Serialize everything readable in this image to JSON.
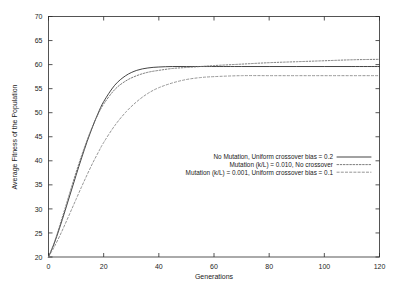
{
  "chart_data": {
    "type": "line",
    "title": "",
    "xlabel": "Generations",
    "ylabel": "Average Fitness of the Population",
    "xlim": [
      0,
      120
    ],
    "ylim": [
      20,
      70
    ],
    "xticks": [
      "0",
      "20",
      "40",
      "60",
      "80",
      "100",
      "120"
    ],
    "xtick_values": [
      0,
      20,
      40,
      60,
      80,
      100,
      120
    ],
    "yticks": [
      "20",
      "25",
      "30",
      "35",
      "40",
      "45",
      "50",
      "55",
      "60",
      "65",
      "70"
    ],
    "ytick_values": [
      20,
      25,
      30,
      35,
      40,
      45,
      50,
      55,
      60,
      65,
      70
    ],
    "grid": false,
    "legend_position": "center-right",
    "x": [
      0,
      2,
      4,
      6,
      8,
      10,
      12,
      14,
      16,
      18,
      20,
      24,
      28,
      32,
      36,
      40,
      45,
      50,
      55,
      60,
      70,
      80,
      90,
      100,
      110,
      120
    ],
    "series": [
      {
        "name": "No Mutation, Uniform crossover bias = 0.2",
        "style": "solid",
        "color": "#2f2f2f",
        "values": [
          20.0,
          22.7,
          26.0,
          29.6,
          33.3,
          37.0,
          40.6,
          44.0,
          47.1,
          49.9,
          52.3,
          55.7,
          57.7,
          58.8,
          59.3,
          59.5,
          59.6,
          59.6,
          59.6,
          59.6,
          59.6,
          59.6,
          59.6,
          59.6,
          59.6,
          59.6
        ]
      },
      {
        "name": "Mutation (k/L) = 0.010, No crossover",
        "style": "dotted",
        "color": "#6e6e6e",
        "values": [
          20.0,
          22.9,
          26.4,
          30.1,
          33.9,
          37.6,
          41.1,
          44.3,
          47.2,
          49.7,
          51.8,
          54.8,
          56.6,
          57.7,
          58.4,
          58.8,
          59.2,
          59.4,
          59.6,
          59.8,
          60.1,
          60.4,
          60.6,
          60.8,
          61.0,
          61.1
        ]
      },
      {
        "name": "Mutation (k/L) = 0.001, Uniform crossover bias = 0.1",
        "style": "dashed",
        "color": "#8a8a8a",
        "values": [
          20.0,
          22.0,
          24.3,
          26.8,
          29.4,
          32.0,
          34.6,
          37.1,
          39.5,
          41.7,
          43.8,
          47.3,
          50.1,
          52.3,
          54.0,
          55.2,
          56.2,
          56.9,
          57.3,
          57.5,
          57.7,
          57.7,
          57.7,
          57.7,
          57.7,
          57.7
        ]
      }
    ]
  },
  "legend": {
    "entries": [
      {
        "label": "No Mutation, Uniform crossover bias = 0.2",
        "style": "solid"
      },
      {
        "label": "Mutation (k/L) = 0.010, No crossover",
        "style": "dotted"
      },
      {
        "label": "Mutation (k/L) = 0.001, Uniform crossover bias = 0.1",
        "style": "dashed"
      }
    ]
  }
}
